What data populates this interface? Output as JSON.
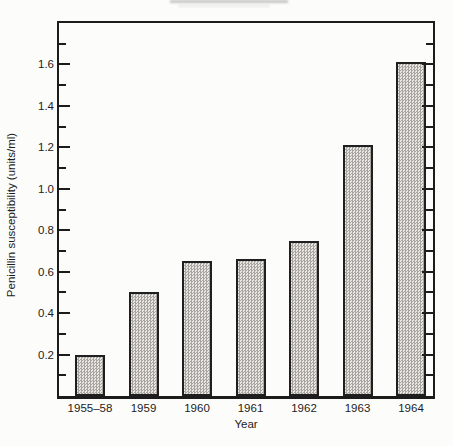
{
  "figure": {
    "kind": "scanned-bar-chart-figure"
  },
  "colors": {
    "background": "#fcfcfa",
    "axis": "#1c1c1c",
    "text": "#1c1c1c",
    "bar_fill_light": "#e9e7e3",
    "bar_fill_dot": "#a8a5a0",
    "bar_outline": "#1f1f1f"
  },
  "chart_data": {
    "type": "bar",
    "title": "",
    "categories": [
      "1955–58",
      "1959",
      "1960",
      "1961",
      "1962",
      "1963",
      "1964"
    ],
    "values": [
      0.2,
      0.5,
      0.65,
      0.66,
      0.75,
      1.21,
      1.61
    ],
    "xlabel": "Year",
    "ylabel": "Penicillin susceptibility (units/ml)",
    "ylim": [
      0,
      1.8
    ],
    "y_major_tick_step": 0.2,
    "y_minor_tick_step": 0.1,
    "y_tick_labels": [
      "0.2",
      "0.4",
      "0.6",
      "0.8",
      "1.0",
      "1.2",
      "1.4",
      "1.6"
    ],
    "grid": false,
    "legend": false,
    "bar_fill_style": "stippled gray halftone",
    "frame": "full box with ticks on left and right spines"
  }
}
